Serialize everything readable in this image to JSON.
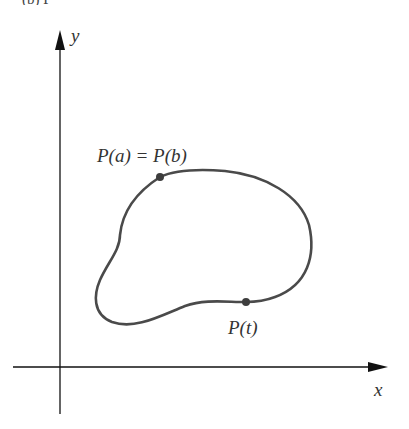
{
  "figure": {
    "caption_fragment": "(b)   P   ",
    "axes": {
      "x_label": "x",
      "y_label": "y",
      "axis_color": "#111111"
    },
    "curve": {
      "description": "closed curve",
      "stroke_color": "#4a4a4a",
      "points": [
        {
          "name": "start-end-point",
          "label": "P(a) = P(b)",
          "x": 160,
          "y": 177
        },
        {
          "name": "general-point",
          "label": "P(t)",
          "x": 246,
          "y": 302
        }
      ]
    }
  }
}
